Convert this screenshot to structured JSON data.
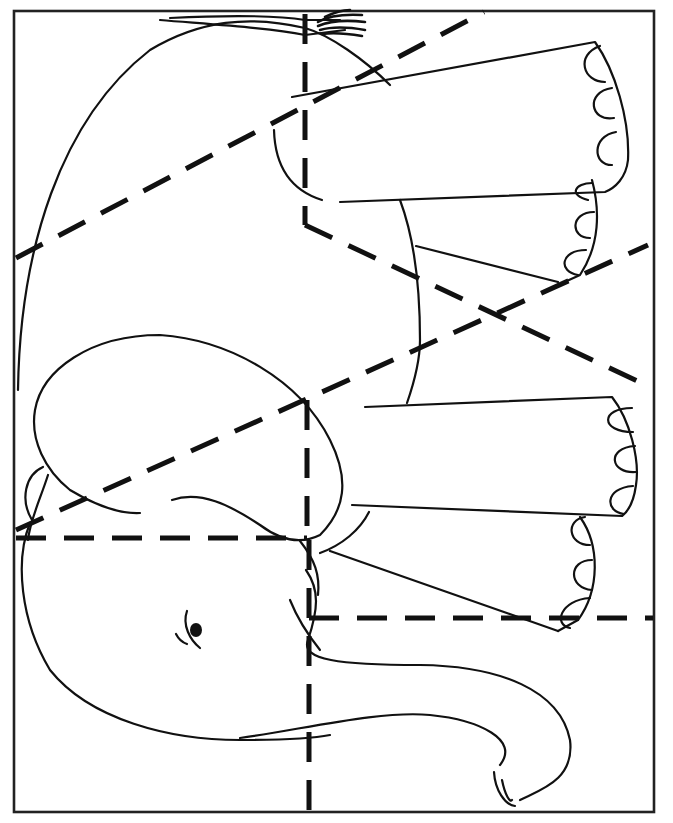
{
  "page": {
    "caption_cropped": "· · ·",
    "frame": {
      "x": 14,
      "y": 11,
      "width": 640,
      "height": 801
    },
    "colors": {
      "ink": "#111111",
      "paper": "#ffffff",
      "frame": "#222222"
    }
  },
  "puzzle": {
    "piece_count_visible_cut_lines": 9,
    "cut_lines": [
      {
        "id": "cut-upper-diagonal",
        "x1": 16,
        "y1": 258,
        "x2": 484,
        "y2": 12
      },
      {
        "id": "cut-upper-vertical",
        "x1": 305,
        "y1": 14,
        "x2": 305,
        "y2": 225
      },
      {
        "id": "cut-upper-right-diagonal",
        "x1": 305,
        "y1": 225,
        "x2": 652,
        "y2": 388
      },
      {
        "id": "cut-middle-diagonal",
        "x1": 16,
        "y1": 530,
        "x2": 648,
        "y2": 245
      },
      {
        "id": "cut-middle-vertical",
        "x1": 307,
        "y1": 400,
        "x2": 307,
        "y2": 540
      },
      {
        "id": "cut-horizontal-left",
        "x1": 16,
        "y1": 538,
        "x2": 307,
        "y2": 538
      },
      {
        "id": "cut-lower-vertical",
        "x1": 309,
        "y1": 540,
        "x2": 309,
        "y2": 812
      },
      {
        "id": "cut-horizontal-right",
        "x1": 309,
        "y1": 618,
        "x2": 653,
        "y2": 618
      }
    ]
  }
}
